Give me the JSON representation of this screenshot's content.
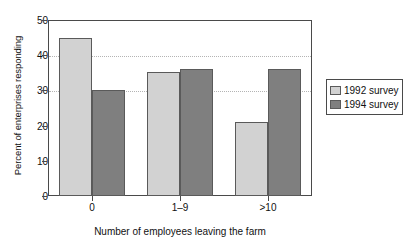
{
  "chart_data": {
    "type": "bar",
    "title": "",
    "subtitle": "",
    "xlabel": "Number of employees leaving the farm",
    "ylabel": "Percent of enterprises responding",
    "categories": [
      "0",
      "1–9",
      ">10"
    ],
    "series": [
      {
        "name": "1992 survey",
        "color": "#d2d2d2",
        "values": [
          45,
          35.2,
          21
        ]
      },
      {
        "name": "1994 survey",
        "color": "#7f7f7f",
        "values": [
          30,
          36,
          36
        ]
      }
    ],
    "ylim": [
      0,
      50
    ],
    "yticks": [
      0,
      10,
      20,
      30,
      40,
      50
    ],
    "ytick_labels": [
      "0",
      "10",
      "20",
      "30",
      "40",
      "50"
    ],
    "grid": "horizontal dotted at 30 and 40",
    "gridlines": [
      30,
      40
    ],
    "legend_position": "right outside"
  },
  "legend": {
    "entries": [
      {
        "label": "1992 survey",
        "swatch": "legend-swatch-1992"
      },
      {
        "label": "1994 survey",
        "swatch": "legend-swatch-1994"
      }
    ]
  },
  "axes": {
    "y_title": "Percent of enterprises responding",
    "x_title": "Number of employees leaving the farm",
    "y_ticks": [
      "0",
      "10",
      "20",
      "30",
      "40",
      "50"
    ],
    "x_ticks": [
      "0",
      "1–9",
      ">10"
    ]
  }
}
